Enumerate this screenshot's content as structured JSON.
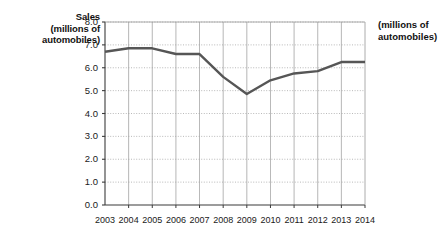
{
  "chart_data": {
    "type": "line",
    "title": "",
    "ylabel": "Sales (millions of automobiles)",
    "ylabel_lines": [
      "Sales",
      "(millions of",
      "automobiles)"
    ],
    "ylabel_right_lines": [
      "(millions of",
      "automobiles)"
    ],
    "xlabel": "",
    "categories": [
      "2003",
      "2004",
      "2005",
      "2006",
      "2007",
      "2008",
      "2009",
      "2010",
      "2011",
      "2012",
      "2013",
      "2014"
    ],
    "values": [
      6.7,
      6.85,
      6.85,
      6.6,
      6.6,
      5.6,
      4.85,
      5.45,
      5.75,
      5.85,
      6.25,
      6.25
    ],
    "ylim": [
      0.0,
      8.0
    ],
    "ytick_labels": [
      "8.0",
      "7.0",
      "6.0",
      "5.0",
      "4.0",
      "3.0",
      "2.0",
      "1.0",
      "0.0"
    ],
    "ytick_values": [
      8.0,
      7.0,
      6.0,
      5.0,
      4.0,
      3.0,
      2.0,
      1.0,
      0.0
    ],
    "grid": true,
    "grid_horizontal": true,
    "grid_vertical": true,
    "legend": false,
    "legend_position": "none",
    "series": [
      {
        "name": "Sales",
        "color": "#565656",
        "values": [
          6.7,
          6.85,
          6.85,
          6.6,
          6.6,
          5.6,
          4.85,
          5.45,
          5.75,
          5.85,
          6.25,
          6.25
        ]
      }
    ]
  },
  "colors": {
    "line": "#565656",
    "axis": "#3b3b3b",
    "grid": "#9a9a9a",
    "background": "#ffffff",
    "text": "#1a1a1a"
  },
  "axes": {
    "y_title_line1": "Sales",
    "y_title_line2": "(millions of",
    "y_title_line3": "automobiles)",
    "y_title_right_line1": "(millions of",
    "y_title_right_line2": "automobiles)"
  }
}
